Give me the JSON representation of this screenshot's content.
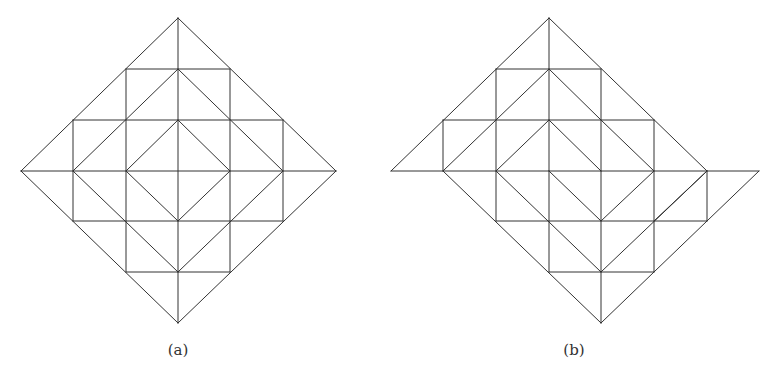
{
  "figure": {
    "line_color": "#333333",
    "line_width": 1,
    "rows_y": [
      18,
      69,
      120,
      171,
      221,
      272,
      323
    ],
    "panels": [
      {
        "id": "a",
        "caption": "(a)",
        "caption_x": 178,
        "cols_x": [
          21,
          73,
          126,
          178,
          230,
          283,
          336
        ],
        "description": "Square lattice rotated into a diamond, subdivided into a 6x6 triangulated grid with three nested diamonds",
        "edges": [
          [
            [
              0,
              3
            ],
            [
              3,
              0
            ]
          ],
          [
            [
              3,
              0
            ],
            [
              6,
              3
            ]
          ],
          [
            [
              6,
              3
            ],
            [
              3,
              6
            ]
          ],
          [
            [
              3,
              6
            ],
            [
              0,
              3
            ]
          ],
          [
            [
              0,
              3
            ],
            [
              6,
              3
            ]
          ],
          [
            [
              3,
              0
            ],
            [
              3,
              6
            ]
          ],
          [
            [
              2,
              1
            ],
            [
              4,
              1
            ]
          ],
          [
            [
              1,
              2
            ],
            [
              5,
              2
            ]
          ],
          [
            [
              1,
              4
            ],
            [
              5,
              4
            ]
          ],
          [
            [
              2,
              5
            ],
            [
              4,
              5
            ]
          ],
          [
            [
              2,
              1
            ],
            [
              2,
              5
            ]
          ],
          [
            [
              4,
              1
            ],
            [
              4,
              5
            ]
          ],
          [
            [
              1,
              2
            ],
            [
              1,
              4
            ]
          ],
          [
            [
              5,
              2
            ],
            [
              5,
              4
            ]
          ],
          [
            [
              1,
              3
            ],
            [
              3,
              1
            ]
          ],
          [
            [
              3,
              1
            ],
            [
              5,
              3
            ]
          ],
          [
            [
              5,
              3
            ],
            [
              3,
              5
            ]
          ],
          [
            [
              3,
              5
            ],
            [
              1,
              3
            ]
          ],
          [
            [
              2,
              3
            ],
            [
              3,
              2
            ]
          ],
          [
            [
              3,
              2
            ],
            [
              4,
              3
            ]
          ],
          [
            [
              4,
              3
            ],
            [
              3,
              4
            ]
          ],
          [
            [
              3,
              4
            ],
            [
              2,
              3
            ]
          ]
        ]
      },
      {
        "id": "b",
        "caption": "(b)",
        "caption_x": 574,
        "cols_x": [
          391,
          443,
          496,
          549,
          601,
          654,
          707,
          759
        ],
        "description": "Rearranged diamond lattice with triangular flaps on left and right and sheared internal diagonals",
        "edges": [
          [
            [
              0,
              3
            ],
            [
              3,
              0
            ]
          ],
          [
            [
              3,
              0
            ],
            [
              6,
              3
            ]
          ],
          [
            [
              0,
              3
            ],
            [
              7,
              3
            ]
          ],
          [
            [
              6,
              4
            ],
            [
              7,
              3
            ]
          ],
          [
            [
              1,
              3
            ],
            [
              4,
              6
            ]
          ],
          [
            [
              4,
              6
            ],
            [
              6,
              4
            ]
          ],
          [
            [
              3,
              0
            ],
            [
              3,
              3
            ]
          ],
          [
            [
              4,
              3
            ],
            [
              4,
              6
            ]
          ],
          [
            [
              2,
              1
            ],
            [
              4,
              1
            ]
          ],
          [
            [
              1,
              2
            ],
            [
              5,
              2
            ]
          ],
          [
            [
              2,
              4
            ],
            [
              6,
              4
            ]
          ],
          [
            [
              3,
              5
            ],
            [
              5,
              5
            ]
          ],
          [
            [
              2,
              1
            ],
            [
              2,
              4
            ]
          ],
          [
            [
              4,
              1
            ],
            [
              4,
              3
            ]
          ],
          [
            [
              1,
              2
            ],
            [
              1,
              3
            ]
          ],
          [
            [
              5,
              2
            ],
            [
              5,
              5
            ]
          ],
          [
            [
              3,
              3
            ],
            [
              3,
              5
            ]
          ],
          [
            [
              6,
              3
            ],
            [
              6,
              4
            ]
          ],
          [
            [
              1,
              3
            ],
            [
              3,
              1
            ]
          ],
          [
            [
              3,
              1
            ],
            [
              4,
              2
            ]
          ],
          [
            [
              4,
              2
            ],
            [
              5,
              3
            ]
          ],
          [
            [
              2,
              3
            ],
            [
              3,
              2
            ]
          ],
          [
            [
              3,
              2
            ],
            [
              4,
              3
            ]
          ],
          [
            [
              2,
              3
            ],
            [
              4,
              5
            ]
          ],
          [
            [
              3,
              3
            ],
            [
              4,
              4
            ]
          ],
          [
            [
              4,
              4
            ],
            [
              5,
              3
            ]
          ],
          [
            [
              4,
              5
            ],
            [
              6,
              3
            ]
          ],
          [
            [
              5,
              4
            ],
            [
              6,
              3
            ]
          ]
        ]
      }
    ]
  }
}
